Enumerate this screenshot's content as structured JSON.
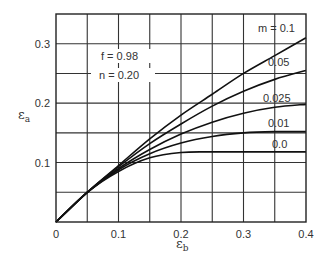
{
  "chart_data": {
    "type": "line",
    "title": "",
    "xlabel": "ε_b",
    "ylabel": "ε_a",
    "xlim": [
      0,
      0.4
    ],
    "ylim": [
      0,
      0.35
    ],
    "grid": true,
    "xticks": [
      "0",
      "0.1",
      "0.2",
      "0.3",
      "0.4"
    ],
    "yticks": [
      "0.1",
      "0.2",
      "0.3"
    ],
    "annotations": {
      "f": "f = 0.98",
      "n": "n = 0.20"
    },
    "series": [
      {
        "name": "m = 0.1",
        "label": "m = 0.1",
        "x": [
          0,
          0.05,
          0.1,
          0.15,
          0.2,
          0.25,
          0.3,
          0.35,
          0.4
        ],
        "y": [
          0,
          0.05,
          0.095,
          0.14,
          0.18,
          0.215,
          0.25,
          0.28,
          0.31
        ]
      },
      {
        "name": "m = 0.05",
        "label": "0.05",
        "x": [
          0,
          0.05,
          0.1,
          0.15,
          0.2,
          0.25,
          0.3,
          0.35,
          0.4
        ],
        "y": [
          0,
          0.05,
          0.093,
          0.132,
          0.165,
          0.195,
          0.22,
          0.24,
          0.255
        ]
      },
      {
        "name": "m = 0.025",
        "label": "0.025",
        "x": [
          0,
          0.05,
          0.1,
          0.15,
          0.2,
          0.25,
          0.3,
          0.35,
          0.4
        ],
        "y": [
          0,
          0.05,
          0.09,
          0.122,
          0.148,
          0.168,
          0.183,
          0.193,
          0.198
        ]
      },
      {
        "name": "m = 0.01",
        "label": "0.01",
        "x": [
          0,
          0.05,
          0.1,
          0.15,
          0.2,
          0.25,
          0.3,
          0.35,
          0.4
        ],
        "y": [
          0,
          0.05,
          0.088,
          0.115,
          0.133,
          0.144,
          0.15,
          0.152,
          0.152
        ]
      },
      {
        "name": "m = 0.0",
        "label": "0.0",
        "x": [
          0,
          0.05,
          0.1,
          0.15,
          0.2,
          0.25,
          0.3,
          0.35,
          0.4
        ],
        "y": [
          0,
          0.05,
          0.085,
          0.108,
          0.117,
          0.118,
          0.118,
          0.118,
          0.118
        ]
      }
    ],
    "legend_position": "inline-right"
  }
}
